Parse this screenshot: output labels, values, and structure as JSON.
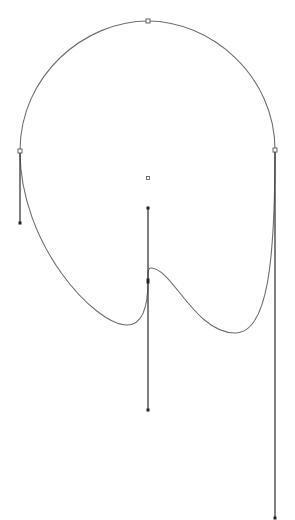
{
  "canvas": {
    "width": 295,
    "height": 520,
    "background": "#ffffff"
  },
  "colors": {
    "curve": "#6e6e6e",
    "handle": "#3a3a3a",
    "anchor_fill": "#ffffff",
    "anchor_stroke": "#555555",
    "handle_point": "#222222"
  },
  "path": {
    "closed": true,
    "anchors": [
      {
        "id": "top",
        "x": 148,
        "y": 21,
        "type": "open-square"
      },
      {
        "id": "right",
        "x": 275,
        "y": 150,
        "type": "open-square"
      },
      {
        "id": "middle",
        "x": 148,
        "y": 281,
        "type": "filled-point"
      },
      {
        "id": "left",
        "x": 20,
        "y": 151,
        "type": "open-square"
      }
    ],
    "handles": [
      {
        "id": "left-handle",
        "from": [
          20,
          151
        ],
        "to": [
          20,
          223
        ]
      },
      {
        "id": "right-handle",
        "from": [
          275,
          150
        ],
        "to": [
          275,
          518
        ]
      },
      {
        "id": "middle-handle",
        "from": [
          148,
          208
        ],
        "to": [
          148,
          410
        ]
      }
    ],
    "center_mark": {
      "x": 148,
      "y": 178
    }
  }
}
